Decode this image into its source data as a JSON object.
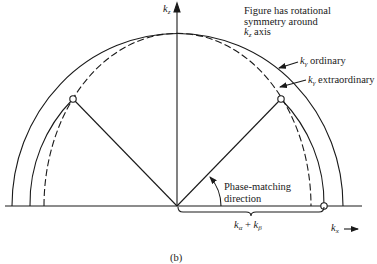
{
  "figure": {
    "caption": "(b)",
    "note_lines": [
      "Figure has rotational",
      "symmetry around",
      "axis"
    ],
    "note_axis_symbol": "k",
    "note_axis_sub": "z",
    "axes": {
      "vertical": {
        "symbol": "k",
        "sub": "z"
      },
      "horizontal": {
        "symbol": "k",
        "sub": "x"
      }
    },
    "curves": [
      {
        "name": "ordinary",
        "symbol": "k",
        "sub": "γ",
        "text": "ordinary",
        "style": "solid"
      },
      {
        "name": "extraordinary",
        "symbol": "k",
        "sub": "γ",
        "text": "extraordinary",
        "style": "dashed"
      },
      {
        "name": "sum",
        "style": "solid",
        "label": "kα + kβ"
      }
    ],
    "sum_label": {
      "k1": "k",
      "s1": "α",
      "plus": "+",
      "k2": "k",
      "s2": "β"
    },
    "phase_matching": {
      "line1": "Phase-matching",
      "line2": "direction"
    },
    "colors": {
      "ink": "#1a1a1a",
      "background": "#ffffff"
    }
  }
}
